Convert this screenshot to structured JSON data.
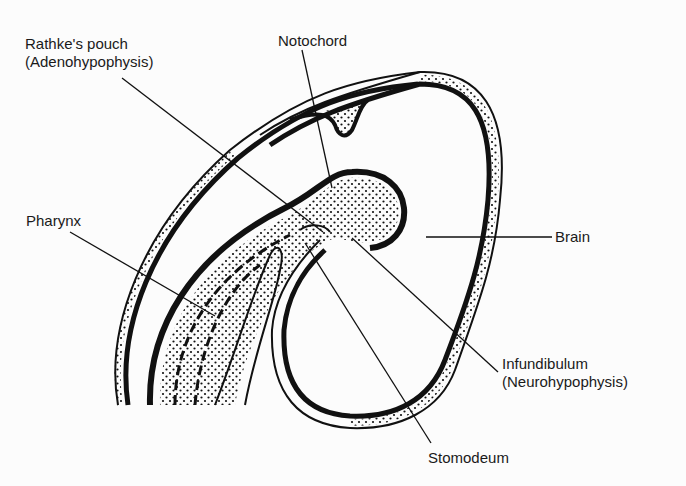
{
  "diagram": {
    "colors": {
      "ink": "#111111",
      "background": "#fcfcfc"
    },
    "labels": {
      "rathkes_pouch": "Rathke's pouch",
      "adenohypophysis": "(Adenohypophysis)",
      "notochord": "Notochord",
      "pharynx": "Pharynx",
      "brain": "Brain",
      "infundibulum": "Infundibulum",
      "neurohypophysis": "(Neurohypophysis)",
      "stomodeum": "Stomodeum"
    }
  }
}
